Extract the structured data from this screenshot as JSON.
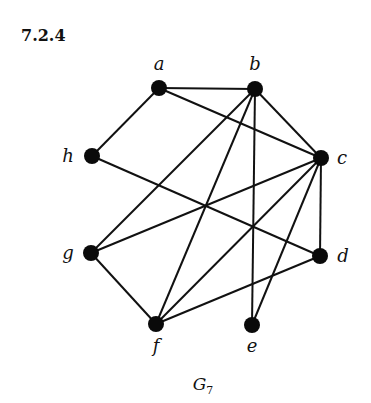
{
  "heading": "7.2.4",
  "graph": {
    "name": "G",
    "name_subscript": "7",
    "vertices": [
      {
        "id": "a",
        "label": "a",
        "x": 159,
        "y": 88,
        "lx": 159,
        "ly": 70
      },
      {
        "id": "b",
        "label": "b",
        "x": 255,
        "y": 89,
        "lx": 255,
        "ly": 70
      },
      {
        "id": "c",
        "label": "c",
        "x": 321,
        "y": 158,
        "lx": 342,
        "ly": 164
      },
      {
        "id": "d",
        "label": "d",
        "x": 320,
        "y": 256,
        "lx": 343,
        "ly": 262
      },
      {
        "id": "e",
        "label": "e",
        "x": 252,
        "y": 325,
        "lx": 252,
        "ly": 352
      },
      {
        "id": "f",
        "label": "f",
        "x": 156,
        "y": 324,
        "lx": 156,
        "ly": 352
      },
      {
        "id": "g",
        "label": "g",
        "x": 91,
        "y": 253,
        "lx": 68,
        "ly": 259
      },
      {
        "id": "h",
        "label": "h",
        "x": 92,
        "y": 156,
        "lx": 68,
        "ly": 162
      }
    ],
    "edges": [
      [
        "a",
        "b"
      ],
      [
        "a",
        "h"
      ],
      [
        "a",
        "c"
      ],
      [
        "b",
        "c"
      ],
      [
        "b",
        "g"
      ],
      [
        "b",
        "f"
      ],
      [
        "b",
        "e"
      ],
      [
        "h",
        "d"
      ],
      [
        "c",
        "g"
      ],
      [
        "c",
        "f"
      ],
      [
        "c",
        "e"
      ],
      [
        "c",
        "d"
      ],
      [
        "g",
        "f"
      ],
      [
        "f",
        "d"
      ]
    ],
    "caption_x": 203,
    "caption_y": 390
  }
}
